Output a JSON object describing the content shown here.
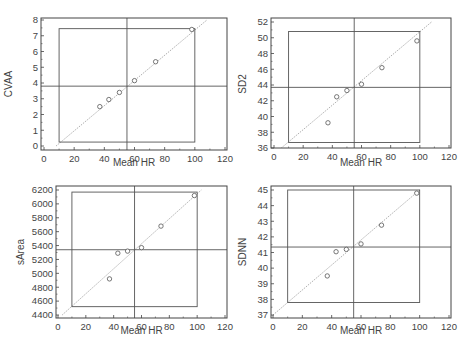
{
  "chart_data": [
    {
      "type": "scatter",
      "id": "cvaa",
      "title": "",
      "xlabel": "Mean HR",
      "ylabel": "CVAA",
      "xlim": [
        0,
        120
      ],
      "ylim": [
        0,
        8
      ],
      "xticks": [
        0,
        20,
        40,
        60,
        80,
        100,
        120
      ],
      "yticks": [
        0,
        1,
        2,
        3,
        4,
        5,
        6,
        7,
        8
      ],
      "grid": false,
      "marker": "open-circle",
      "points": [
        {
          "x": 37,
          "y": 2.5
        },
        {
          "x": 43,
          "y": 2.95
        },
        {
          "x": 50,
          "y": 3.4
        },
        {
          "x": 60,
          "y": 4.15
        },
        {
          "x": 74,
          "y": 5.35
        },
        {
          "x": 98,
          "y": 7.4
        }
      ],
      "mean_x": 55,
      "mean_y": 3.8,
      "range_box": {
        "x0": 10,
        "x1": 100,
        "y0": 0.25,
        "y1": 7.45
      },
      "regression_line": {
        "x0": 8,
        "y0": 0,
        "x1": 108,
        "y1": 8
      }
    },
    {
      "type": "scatter",
      "id": "sd2",
      "title": "",
      "xlabel": "Mean HR",
      "ylabel": "SD2",
      "xlim": [
        0,
        120
      ],
      "ylim": [
        36,
        52
      ],
      "xticks": [
        0,
        20,
        40,
        60,
        80,
        100,
        120
      ],
      "yticks": [
        36,
        38,
        40,
        42,
        44,
        46,
        48,
        50,
        52
      ],
      "grid": false,
      "marker": "open-circle",
      "points": [
        {
          "x": 37,
          "y": 39.2
        },
        {
          "x": 43,
          "y": 42.5
        },
        {
          "x": 50,
          "y": 43.3
        },
        {
          "x": 60,
          "y": 44.1
        },
        {
          "x": 74,
          "y": 46.2
        },
        {
          "x": 98,
          "y": 49.6
        }
      ],
      "mean_x": 55,
      "mean_y": 43.7,
      "range_box": {
        "x0": 10,
        "x1": 100,
        "y0": 36.7,
        "y1": 50.8
      },
      "regression_line": {
        "x0": 5,
        "y0": 36,
        "x1": 108,
        "y1": 52
      }
    },
    {
      "type": "scatter",
      "id": "sarea",
      "title": "",
      "xlabel": "Mean HR",
      "ylabel": "sArea",
      "xlim": [
        0,
        120
      ],
      "ylim": [
        4400,
        6200
      ],
      "xticks": [
        0,
        20,
        40,
        60,
        80,
        100,
        120
      ],
      "yticks": [
        4400,
        4600,
        4800,
        5000,
        5200,
        5400,
        5600,
        5800,
        6000,
        6200
      ],
      "grid": false,
      "marker": "open-circle",
      "points": [
        {
          "x": 37,
          "y": 4920
        },
        {
          "x": 43,
          "y": 5290
        },
        {
          "x": 50,
          "y": 5320
        },
        {
          "x": 60,
          "y": 5370
        },
        {
          "x": 74,
          "y": 5680
        },
        {
          "x": 98,
          "y": 6120
        }
      ],
      "mean_x": 55,
      "mean_y": 5340,
      "range_box": {
        "x0": 10,
        "x1": 100,
        "y0": 4520,
        "y1": 6170
      },
      "regression_line": {
        "x0": 3,
        "y0": 4400,
        "x1": 103,
        "y1": 6200
      }
    },
    {
      "type": "scatter",
      "id": "sdnn",
      "title": "",
      "xlabel": "Mean HR",
      "ylabel": "SDNN",
      "xlim": [
        0,
        120
      ],
      "ylim": [
        37,
        45
      ],
      "xticks": [
        0,
        20,
        40,
        60,
        80,
        100,
        120
      ],
      "yticks": [
        37,
        38,
        39,
        40,
        41,
        42,
        43,
        44,
        45
      ],
      "grid": false,
      "marker": "open-circle",
      "points": [
        {
          "x": 37,
          "y": 39.5
        },
        {
          "x": 43,
          "y": 41.05
        },
        {
          "x": 50,
          "y": 41.2
        },
        {
          "x": 60,
          "y": 41.55
        },
        {
          "x": 74,
          "y": 42.75
        },
        {
          "x": 98,
          "y": 44.8
        }
      ],
      "mean_x": 55,
      "mean_y": 41.35,
      "range_box": {
        "x0": 10,
        "x1": 100,
        "y0": 37.8,
        "y1": 45
      },
      "regression_line": {
        "x0": 0,
        "y0": 37,
        "x1": 100,
        "y1": 45
      }
    }
  ],
  "layout": {
    "panels": [
      {
        "chart": 0,
        "frame": {
          "left": 41,
          "top": 18,
          "right": 227,
          "bottom": 150
        },
        "xmap": {
          "x0px": 44,
          "x1px": 225
        },
        "ymap": {
          "y0px": 146,
          "y1px": 20
        },
        "xlabel_y": 166,
        "ylabel_x": 12,
        "ylabel_cy": 84
      },
      {
        "chart": 1,
        "frame": {
          "left": 271,
          "top": 18,
          "right": 451,
          "bottom": 148
        },
        "xmap": {
          "x0px": 274,
          "x1px": 449
        },
        "ymap": {
          "y0px": 148,
          "y1px": 22
        },
        "xlabel_y": 166,
        "ylabel_x": 246,
        "ylabel_cy": 84
      },
      {
        "chart": 2,
        "frame": {
          "left": 56,
          "top": 186,
          "right": 227,
          "bottom": 318
        },
        "xmap": {
          "x0px": 58,
          "x1px": 225
        },
        "ymap": {
          "y0px": 315,
          "y1px": 190
        },
        "xlabel_y": 334,
        "ylabel_x": 24,
        "ylabel_cy": 252
      },
      {
        "chart": 3,
        "frame": {
          "left": 271,
          "top": 186,
          "right": 451,
          "bottom": 318
        },
        "xmap": {
          "x0px": 273,
          "x1px": 449
        },
        "ymap": {
          "y0px": 315,
          "y1px": 190
        },
        "xlabel_y": 334,
        "ylabel_x": 246,
        "ylabel_cy": 252
      }
    ]
  },
  "colors": {
    "frame": "#444444",
    "mean_lines": "#555555",
    "range_box": "#555555",
    "regression": "#999999",
    "markers": "#555555",
    "text": "#444444"
  }
}
